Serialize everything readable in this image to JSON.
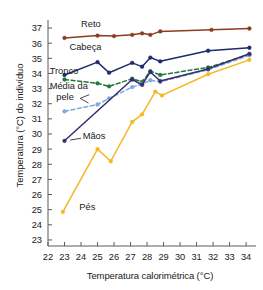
{
  "chart_data": {
    "type": "line",
    "title": "",
    "xlabel": "Temperatura calorimétrica (°C)",
    "ylabel": "Temperatura (°C) do indivíduo",
    "xlim": [
      22,
      34.6
    ],
    "ylim": [
      22.6,
      37.4
    ],
    "xticks": [
      22,
      23,
      24,
      25,
      26,
      27,
      28,
      29,
      30,
      31,
      32,
      33,
      34
    ],
    "yticks": [
      23,
      24,
      25,
      26,
      27,
      28,
      29,
      30,
      31,
      32,
      33,
      34,
      35,
      36,
      37
    ],
    "grid": false,
    "legend": "inline-annotations",
    "series": [
      {
        "name": "Reto",
        "label": "Reto",
        "color": "#8c3c1e",
        "style": "solid",
        "marker": "circle",
        "points": [
          [
            23.0,
            36.35
          ],
          [
            25.0,
            36.5
          ],
          [
            26.0,
            36.47
          ],
          [
            27.1,
            36.55
          ],
          [
            27.7,
            36.65
          ],
          [
            28.2,
            36.55
          ],
          [
            28.8,
            36.78
          ],
          [
            31.9,
            36.88
          ],
          [
            34.2,
            36.97
          ]
        ]
      },
      {
        "name": "Cabeça",
        "label": "Cabeça",
        "color": "#1f2a6e",
        "style": "solid",
        "marker": "circle",
        "points": [
          [
            23.0,
            33.9
          ],
          [
            25.0,
            34.75
          ],
          [
            25.7,
            34.05
          ],
          [
            27.1,
            34.7
          ],
          [
            27.7,
            34.45
          ],
          [
            28.2,
            35.05
          ],
          [
            28.8,
            34.8
          ],
          [
            31.7,
            35.5
          ],
          [
            34.2,
            35.7
          ]
        ]
      },
      {
        "name": "Tronco",
        "label": "Tronco",
        "color": "#1d7a3a",
        "style": "dashed",
        "marker": "circle",
        "points": [
          [
            23.0,
            33.6
          ],
          [
            25.0,
            33.35
          ],
          [
            25.7,
            33.15
          ],
          [
            27.1,
            33.65
          ],
          [
            27.7,
            33.45
          ],
          [
            28.2,
            34.15
          ],
          [
            28.8,
            33.9
          ],
          [
            31.7,
            34.4
          ],
          [
            34.2,
            35.25
          ]
        ]
      },
      {
        "name": "Média da pele",
        "label": "Média da pele",
        "color": "#7aa9dd",
        "style": "dashed",
        "marker": "circle",
        "points": [
          [
            23.0,
            31.5
          ],
          [
            25.0,
            31.95
          ],
          [
            25.7,
            32.35
          ],
          [
            27.1,
            33.1
          ],
          [
            27.7,
            33.3
          ],
          [
            28.2,
            33.55
          ],
          [
            28.8,
            33.45
          ],
          [
            31.7,
            34.25
          ],
          [
            34.2,
            35.2
          ]
        ]
      },
      {
        "name": "Mãos",
        "label": "Mãos",
        "color": "#3b2a6e",
        "style": "solid",
        "marker": "circle",
        "points": [
          [
            23.0,
            29.55
          ],
          [
            27.1,
            33.6
          ],
          [
            27.7,
            33.25
          ],
          [
            28.2,
            34.1
          ],
          [
            28.8,
            33.5
          ],
          [
            31.7,
            34.3
          ],
          [
            34.2,
            35.3
          ]
        ]
      },
      {
        "name": "Pés",
        "label": "Pés",
        "color": "#f5b823",
        "style": "solid",
        "marker": "circle",
        "points": [
          [
            22.9,
            24.85
          ],
          [
            25.0,
            29.0
          ],
          [
            25.8,
            28.2
          ],
          [
            27.1,
            30.8
          ],
          [
            27.7,
            31.3
          ],
          [
            28.5,
            32.8
          ],
          [
            28.9,
            32.55
          ],
          [
            31.7,
            33.95
          ],
          [
            34.2,
            34.9
          ]
        ]
      }
    ],
    "annotations": [
      {
        "text": "Reto",
        "x": 24.0,
        "y": 37.05,
        "anchor": "start"
      },
      {
        "text": "Cabeça",
        "x": 23.3,
        "y": 35.55,
        "anchor": "start"
      },
      {
        "text": "Tronco",
        "x": 22.1,
        "y": 33.95,
        "anchor": "start"
      },
      {
        "text": "Média da",
        "x": 22.1,
        "y": 33.0,
        "anchor": "start"
      },
      {
        "text": "pele",
        "x": 22.5,
        "y": 32.25,
        "anchor": "start"
      },
      {
        "text": "Mãos",
        "x": 24.1,
        "y": 29.65,
        "anchor": "start"
      },
      {
        "text": "Pés",
        "x": 23.9,
        "y": 25.0,
        "anchor": "start"
      }
    ]
  }
}
